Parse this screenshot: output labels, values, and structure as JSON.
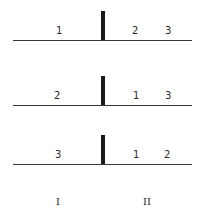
{
  "rows": [
    {
      "left": [
        "1"
      ],
      "right": [
        "2",
        "3"
      ]
    },
    {
      "left": [
        "2"
      ],
      "right": [
        "1",
        "3"
      ]
    },
    {
      "left": [
        "3"
      ],
      "right": [
        "1",
        "2"
      ]
    }
  ],
  "columns": {
    "left_label": "I",
    "right_label": "II"
  }
}
